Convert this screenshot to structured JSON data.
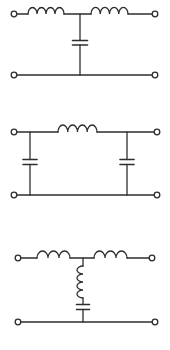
{
  "diagram": {
    "background": "#ffffff",
    "ink_color": "#2e2e2e",
    "stroke_width": 1.3,
    "terminal_radius": 2.8,
    "circuits": [
      {
        "id": "filter-1-t-section-series-l-shunt-c",
        "type": "T-section filter: series inductor, shunt capacitor, series inductor",
        "rails": {
          "top_y": 14,
          "bottom_y": 75
        },
        "terminals": [
          {
            "x": 14,
            "y": 14
          },
          {
            "x": 155,
            "y": 14
          },
          {
            "x": 14,
            "y": 75
          },
          {
            "x": 155,
            "y": 75
          }
        ],
        "top_path": [
          {
            "kind": "wire",
            "x1": 16.8,
            "x2": 28
          },
          {
            "kind": "inductor",
            "x1": 28,
            "x2": 64,
            "loops": 4
          },
          {
            "kind": "wire",
            "x1": 64,
            "x2": 91
          },
          {
            "kind": "inductor",
            "x1": 91,
            "x2": 128,
            "loops": 4
          },
          {
            "kind": "wire",
            "x1": 128,
            "x2": 152.2
          }
        ],
        "bottom_wire": {
          "x1": 16.8,
          "x2": 152.2
        },
        "shunts": [
          {
            "x": 80,
            "components": [
              {
                "kind": "capacitor",
                "plate_top_y": 40.5,
                "plate_bottom_y": 45,
                "plate_width": 15
              }
            ]
          }
        ]
      },
      {
        "id": "filter-2-pi-section-shunt-c-series-l",
        "type": "Pi-section filter: shunt capacitor, series inductor, shunt capacitor",
        "rails": {
          "top_y": 132,
          "bottom_y": 195
        },
        "terminals": [
          {
            "x": 14,
            "y": 132
          },
          {
            "x": 157,
            "y": 132
          },
          {
            "x": 14,
            "y": 195
          },
          {
            "x": 157,
            "y": 195
          }
        ],
        "top_path": [
          {
            "kind": "wire",
            "x1": 16.8,
            "x2": 58
          },
          {
            "kind": "inductor",
            "x1": 58,
            "x2": 97,
            "loops": 4
          },
          {
            "kind": "wire",
            "x1": 97,
            "x2": 154.2
          }
        ],
        "bottom_wire": {
          "x1": 16.8,
          "x2": 154.2
        },
        "shunts": [
          {
            "x": 30,
            "components": [
              {
                "kind": "capacitor",
                "plate_top_y": 159.5,
                "plate_bottom_y": 164.5,
                "plate_width": 14
              }
            ]
          },
          {
            "x": 127,
            "components": [
              {
                "kind": "capacitor",
                "plate_top_y": 159.5,
                "plate_bottom_y": 164.5,
                "plate_width": 14
              }
            ]
          }
        ]
      },
      {
        "id": "filter-3-t-section-series-lc-shunt",
        "type": "T-section filter: series inductors with shunt branch of inductor in series with capacitor",
        "rails": {
          "top_y": 258,
          "bottom_y": 322
        },
        "terminals": [
          {
            "x": 18,
            "y": 258
          },
          {
            "x": 152,
            "y": 258
          },
          {
            "x": 18,
            "y": 322
          },
          {
            "x": 155,
            "y": 322
          }
        ],
        "top_path": [
          {
            "kind": "wire",
            "x1": 20.8,
            "x2": 37
          },
          {
            "kind": "inductor",
            "x1": 37,
            "x2": 70,
            "loops": 3
          },
          {
            "kind": "wire",
            "x1": 70,
            "x2": 94
          },
          {
            "kind": "inductor",
            "x1": 94,
            "x2": 127,
            "loops": 3
          },
          {
            "kind": "wire",
            "x1": 127,
            "x2": 149.2
          }
        ],
        "bottom_wire": {
          "x1": 20.8,
          "x2": 152.2
        },
        "shunts": [
          {
            "x": 83,
            "components": [
              {
                "kind": "inductor",
                "y1": 266,
                "y2": 298,
                "loops": 4
              },
              {
                "kind": "capacitor",
                "plate_top_y": 304.5,
                "plate_bottom_y": 309.5,
                "plate_width": 13
              }
            ]
          }
        ]
      }
    ]
  }
}
